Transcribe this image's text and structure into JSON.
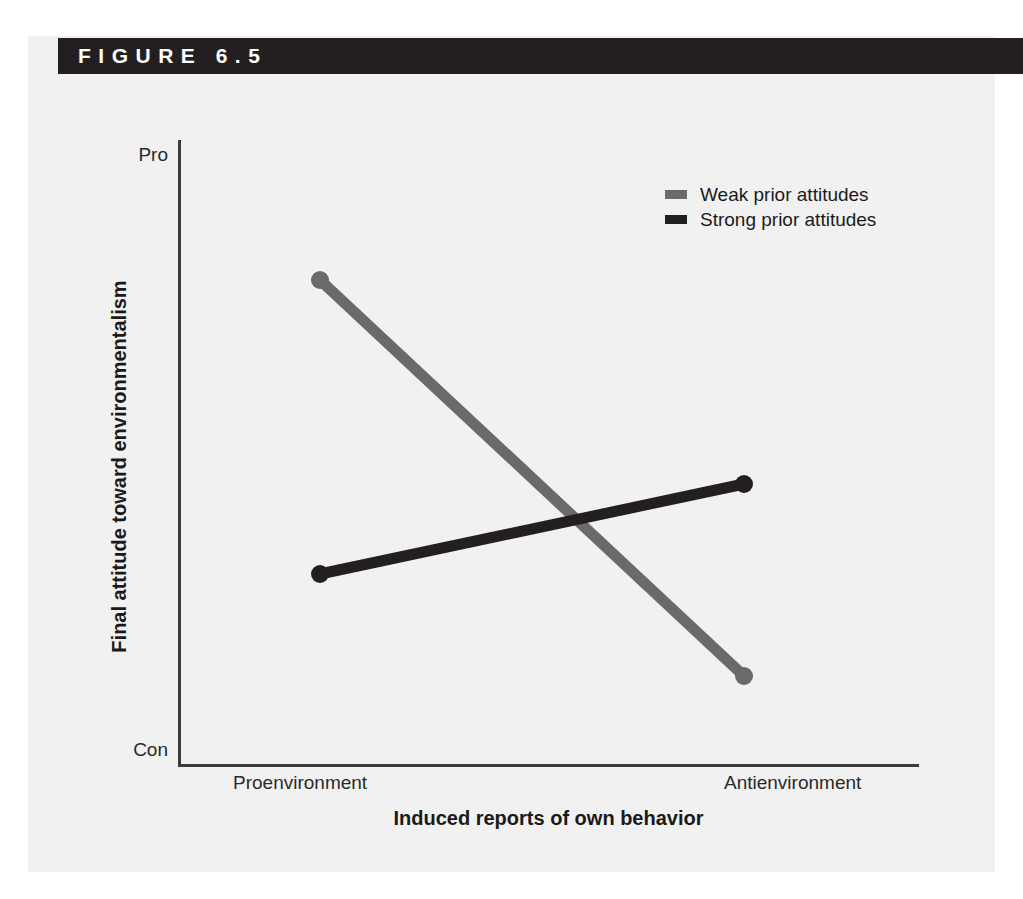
{
  "figure": {
    "number_label": "FIGURE 6.5",
    "header_bg": "#231f20",
    "panel_bg": "#f1f1f1"
  },
  "chart_data": {
    "type": "line",
    "title": "FIGURE 6.5",
    "xlabel": "Induced reports of own behavior",
    "ylabel": "Final attitude toward environmentalism",
    "categories": [
      "Proenvironment",
      "Antienvironment"
    ],
    "x_tick_labels": [
      "Proenvironment",
      "Antienvironment"
    ],
    "y_tick_labels": [
      "Pro",
      "Con"
    ],
    "ylim_labels": {
      "top": "Pro",
      "bottom": "Con"
    },
    "grid": false,
    "legend_position": "upper-right-inside",
    "series": [
      {
        "name": "Weak prior attitudes",
        "color": "#6a6a6a",
        "values": [
          0.8,
          0.14
        ],
        "points": [
          {
            "category": "Proenvironment",
            "value": 0.8
          },
          {
            "category": "Antienvironment",
            "value": 0.14
          }
        ]
      },
      {
        "name": "Strong prior attitudes",
        "color": "#231f20",
        "values": [
          0.31,
          0.46
        ],
        "points": [
          {
            "category": "Proenvironment",
            "value": 0.31
          },
          {
            "category": "Antienvironment",
            "value": 0.46
          }
        ]
      }
    ]
  },
  "legend": {
    "items": [
      {
        "label": "Weak prior attitudes",
        "color": "#6a6a6a"
      },
      {
        "label": "Strong prior attitudes",
        "color": "#231f20"
      }
    ]
  },
  "axes": {
    "y_top_label": "Pro",
    "y_bottom_label": "Con",
    "x_left_label": "Proenvironment",
    "x_right_label": "Antienvironment",
    "x_title": "Induced reports of own behavior",
    "y_title": "Final attitude toward environmentalism",
    "axis_color": "#3b3b3b"
  }
}
